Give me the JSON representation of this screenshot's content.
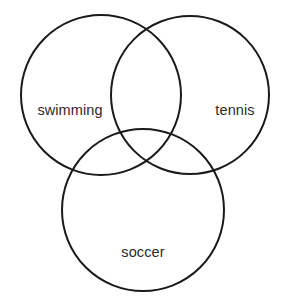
{
  "figure": {
    "type": "venn-diagram",
    "set_count": 3,
    "background_color": "#ffffff",
    "stroke_color": "#1a1a1a",
    "stroke_width": 2,
    "label_color": "#2b2b2b"
  },
  "chart_data": {
    "type": "venn",
    "title": "",
    "sets": [
      {
        "id": "swimming",
        "label": "swimming",
        "center_x": 101,
        "center_y": 95,
        "radius": 80,
        "label_x": 70,
        "label_y": 110
      },
      {
        "id": "tennis",
        "label": "tennis",
        "center_x": 190,
        "center_y": 95,
        "radius": 79,
        "label_x": 235,
        "label_y": 110
      },
      {
        "id": "soccer",
        "label": "soccer",
        "center_x": 143,
        "center_y": 210,
        "radius": 81,
        "label_x": 143,
        "label_y": 252
      }
    ],
    "regions": [
      "swimming only",
      "tennis only",
      "soccer only",
      "swimming ∩ tennis",
      "swimming ∩ soccer",
      "tennis ∩ soccer",
      "swimming ∩ tennis ∩ soccer"
    ],
    "region_values": [],
    "legend": "none",
    "grid": false
  }
}
